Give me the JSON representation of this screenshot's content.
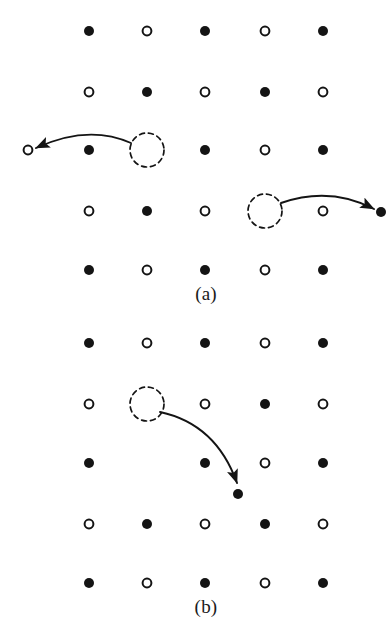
{
  "figure": {
    "type": "diagram",
    "background_color": "#ffffff",
    "ink_color": "#141414",
    "width": 390,
    "height": 643,
    "symbol_legend": {
      "filled_circle": "atom of species A (solid black disc)",
      "open_circle": "atom of species B (hollow circle)",
      "dashed_circle": "vacancy / empty lattice site (dashed outline)",
      "curved_arrow": "atom jump direction into the vacancy"
    },
    "geometry": {
      "columns_x": [
        89,
        147,
        205,
        265,
        323
      ],
      "panel_a_rows_y": [
        31,
        92,
        150,
        211,
        270
      ],
      "panel_b_rows_y": [
        343,
        404,
        463,
        524,
        583
      ],
      "filled_radius": 5,
      "open_radius": 5,
      "open_stroke_width": 2,
      "vacancy_radius": 17,
      "vacancy_dash": "5 4",
      "vacancy_stroke_width": 1.7,
      "arrow_stroke_width": 1.9
    }
  },
  "panels": [
    {
      "id": "panel-a",
      "caption": "(a)",
      "caption_x": 206,
      "caption_y": 294,
      "rows": [
        {
          "row": 1,
          "y": 31,
          "sites": [
            "filled",
            "open",
            "filled",
            "open",
            "filled"
          ]
        },
        {
          "row": 2,
          "y": 92,
          "sites": [
            "open",
            "filled",
            "open",
            "filled",
            "open"
          ]
        },
        {
          "row": 3,
          "y": 150,
          "sites": [
            "filled",
            "vacancy",
            "filled",
            "open",
            "filled"
          ]
        },
        {
          "row": 4,
          "y": 211,
          "sites": [
            "open",
            "filled",
            "open",
            "vacancy",
            "open"
          ]
        },
        {
          "row": 5,
          "y": 270,
          "sites": [
            "filled",
            "open",
            "filled",
            "open",
            "filled"
          ]
        }
      ],
      "extra_symbols": [
        {
          "name": "moved-open-atom-left",
          "kind": "open",
          "x": 28,
          "y": 150
        },
        {
          "name": "moved-filled-atom-right",
          "kind": "filled",
          "x": 381,
          "y": 212
        }
      ],
      "vacancies": [
        {
          "name": "vacancy-row3-col2",
          "x": 147,
          "y": 150
        },
        {
          "name": "vacancy-row4-col4",
          "x": 265,
          "y": 211
        }
      ],
      "arrows": [
        {
          "name": "hop-arrow-leftward",
          "from": [
            131,
            143
          ],
          "to": [
            36,
            148
          ],
          "control": [
            88,
            124
          ],
          "direction": "left",
          "description": "open-circle atom hops leftward out of the row into the far-left position"
        },
        {
          "name": "hop-arrow-rightward",
          "from": [
            281,
            203
          ],
          "to": [
            374,
            209
          ],
          "control": [
            330,
            186
          ],
          "direction": "right",
          "description": "filled atom hops rightward out of the row to the far-right position"
        }
      ]
    },
    {
      "id": "panel-b",
      "caption": "(b)",
      "caption_x": 206,
      "caption_y": 607,
      "rows": [
        {
          "row": 1,
          "y": 343,
          "sites": [
            "filled",
            "open",
            "filled",
            "open",
            "filled"
          ]
        },
        {
          "row": 2,
          "y": 404,
          "sites": [
            "open",
            "vacancy",
            "open",
            "filled",
            "open"
          ]
        },
        {
          "row": 3,
          "y": 463,
          "sites": [
            "filled",
            "empty",
            "filled",
            "open",
            "filled"
          ]
        },
        {
          "row": 4,
          "y": 524,
          "sites": [
            "open",
            "filled",
            "open",
            "filled",
            "open"
          ]
        },
        {
          "row": 5,
          "y": 583,
          "sites": [
            "filled",
            "open",
            "filled",
            "open",
            "filled"
          ]
        }
      ],
      "extra_symbols": [
        {
          "name": "moved-filled-atom-down",
          "kind": "filled",
          "x": 238,
          "y": 494
        }
      ],
      "vacancies": [
        {
          "name": "vacancy-row2-col2",
          "x": 147,
          "y": 404
        }
      ],
      "arrows": [
        {
          "name": "hop-arrow-downright",
          "from": [
            160,
            412
          ],
          "to": [
            237,
            483
          ],
          "control": [
            216,
            424
          ],
          "direction": "down-right",
          "description": "atom hops diagonally down-right into the interstitial position below"
        }
      ]
    }
  ]
}
